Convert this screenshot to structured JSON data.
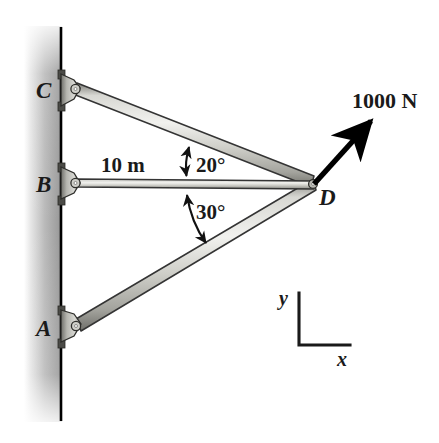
{
  "figure": {
    "background_color": "#ffffff",
    "width": 439,
    "height": 443
  },
  "wall": {
    "name": "vertical-wall",
    "line_color": "#000000",
    "shadow_color": "#9a9a9a"
  },
  "joints": [
    {
      "id": "C",
      "label": "C",
      "x": 65,
      "y": 90,
      "type": "pin-support"
    },
    {
      "id": "B",
      "label": "B",
      "x": 65,
      "y": 183,
      "type": "pin-support"
    },
    {
      "id": "A",
      "label": "A",
      "x": 65,
      "y": 327,
      "type": "pin-support"
    },
    {
      "id": "D",
      "label": "D",
      "x": 313,
      "y": 186,
      "type": "free-joint"
    }
  ],
  "members": [
    {
      "id": "CD",
      "from": "C",
      "to": "D",
      "fill": "#c9c9c4",
      "edge": "#3a3a3a"
    },
    {
      "id": "BD",
      "from": "B",
      "to": "D",
      "fill": "#c9c9c4",
      "edge": "#3a3a3a"
    },
    {
      "id": "AD",
      "from": "A",
      "to": "D",
      "fill": "#c9c9c4",
      "edge": "#3a3a3a"
    }
  ],
  "dimensions": [
    {
      "id": "BD-length",
      "label": "10 m",
      "member": "BD"
    }
  ],
  "angles": [
    {
      "id": "angle-CD-BD",
      "label": "20°",
      "value": 20,
      "unit": "deg",
      "between": [
        "CD",
        "BD"
      ]
    },
    {
      "id": "angle-BD-AD",
      "label": "30°",
      "value": 30,
      "unit": "deg",
      "between": [
        "BD",
        "AD"
      ]
    }
  ],
  "force": {
    "id": "applied-force",
    "label": "1000 N",
    "magnitude": 1000,
    "unit": "N",
    "applied_at": "D",
    "direction_deg": 48,
    "color": "#000000"
  },
  "axes": {
    "name": "coordinate-axes",
    "x_label": "x",
    "y_label": "y",
    "color": "#1a1a1a"
  }
}
